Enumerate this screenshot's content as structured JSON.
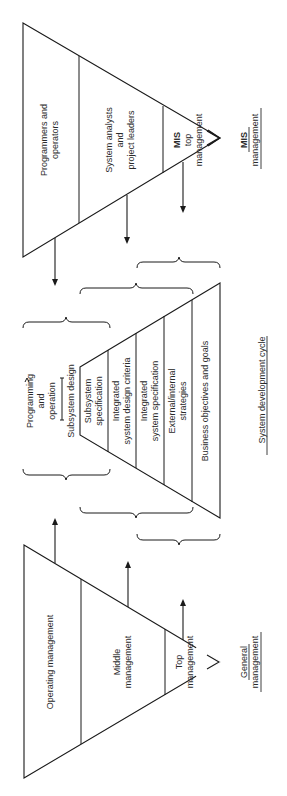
{
  "diagram": {
    "orientation": "rotated 90deg counter-clockwise",
    "colors": {
      "line": "#1a1a1a",
      "text": "#2a2a2a",
      "background": "#ffffff"
    },
    "mis_pyramid": {
      "caption_line1": "MIS",
      "caption_line2": "management",
      "layers": [
        {
          "lines": [
            "Programmers and",
            "operators"
          ]
        },
        {
          "lines": [
            "System analysts",
            "and",
            "project leaders"
          ]
        },
        {
          "lines": [
            "MIS",
            "top",
            "management"
          ]
        }
      ]
    },
    "development_cycle": {
      "caption": "System development cycle",
      "outer_label": {
        "lines": [
          "Programming",
          "and",
          "operation"
        ]
      },
      "top_label": "Subsystem design",
      "layers": [
        {
          "lines": [
            "Subsystem",
            "specification"
          ]
        },
        {
          "lines": [
            "Integrated",
            "system design criteria"
          ]
        },
        {
          "lines": [
            "Integrated",
            "system specification"
          ]
        },
        {
          "lines": [
            "External/internal",
            "strategies"
          ]
        },
        {
          "lines": [
            "Business objectives and goals"
          ]
        }
      ]
    },
    "general_pyramid": {
      "caption_line1": "General",
      "caption_line2": "management",
      "layers": [
        {
          "lines": [
            "Operating management"
          ]
        },
        {
          "lines": [
            "Middle",
            "management"
          ]
        },
        {
          "lines": [
            "Top",
            "management"
          ]
        }
      ]
    }
  }
}
